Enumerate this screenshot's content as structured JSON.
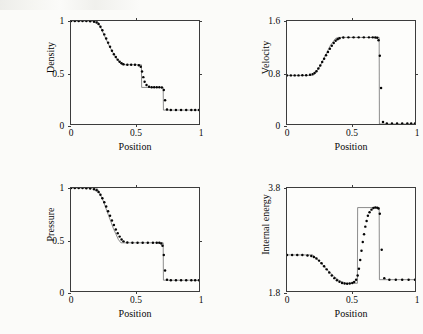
{
  "figure": {
    "type": "scientific-figure",
    "panel_count": 4,
    "background_color": "#fbfbf9",
    "exact_line_color": "#6e6e6e",
    "marker_color": "#050505"
  },
  "axis_title_x": "Position",
  "chart_data": [
    {
      "id": "density",
      "type": "line",
      "title": "",
      "xlabel": "Position",
      "ylabel": "Density",
      "xlim": [
        0,
        1
      ],
      "ylim": [
        0,
        1
      ],
      "xticks": [
        0,
        0.5,
        1
      ],
      "xticklabels": [
        "0",
        "0.5",
        "1"
      ],
      "yticks": [
        0,
        0.5,
        1
      ],
      "yticklabels": [
        "0",
        "0.5",
        "1"
      ],
      "grid": false,
      "legend": "none",
      "series": [
        {
          "name": "exact",
          "style": "thin-line",
          "x": [
            0.0,
            0.2,
            0.215,
            0.26,
            0.3,
            0.34,
            0.38,
            0.4,
            0.55,
            0.552,
            0.72,
            0.722,
            1.0
          ],
          "y": [
            1.0,
            1.0,
            0.985,
            0.86,
            0.755,
            0.665,
            0.595,
            0.575,
            0.575,
            0.355,
            0.355,
            0.135,
            0.135
          ]
        },
        {
          "name": "numerical",
          "style": "thick-dots",
          "x": [
            0.0,
            0.03,
            0.06,
            0.09,
            0.12,
            0.15,
            0.18,
            0.2,
            0.215,
            0.23,
            0.245,
            0.26,
            0.275,
            0.29,
            0.305,
            0.32,
            0.335,
            0.35,
            0.365,
            0.38,
            0.395,
            0.41,
            0.44,
            0.47,
            0.5,
            0.53,
            0.545,
            0.555,
            0.565,
            0.575,
            0.59,
            0.61,
            0.63,
            0.65,
            0.67,
            0.69,
            0.71,
            0.725,
            0.735,
            0.75,
            0.78,
            0.82,
            0.86,
            0.9,
            0.94,
            0.97,
            1.0
          ],
          "y": [
            1.0,
            1.0,
            1.0,
            1.0,
            1.0,
            0.998,
            0.993,
            0.985,
            0.97,
            0.945,
            0.91,
            0.87,
            0.83,
            0.79,
            0.75,
            0.712,
            0.678,
            0.65,
            0.625,
            0.605,
            0.59,
            0.58,
            0.575,
            0.575,
            0.575,
            0.57,
            0.555,
            0.51,
            0.455,
            0.41,
            0.378,
            0.362,
            0.357,
            0.356,
            0.356,
            0.356,
            0.354,
            0.33,
            0.23,
            0.14,
            0.136,
            0.135,
            0.135,
            0.135,
            0.135,
            0.135,
            0.135
          ]
        }
      ]
    },
    {
      "id": "velocity",
      "type": "line",
      "title": "",
      "xlabel": "Position",
      "ylabel": "Velocity",
      "xlim": [
        0,
        1
      ],
      "ylim": [
        0,
        1.6
      ],
      "xticks": [
        0,
        0.5,
        1
      ],
      "xticklabels": [
        "0",
        "0.5",
        "1"
      ],
      "yticks": [
        0,
        0.8,
        1.6
      ],
      "yticklabels": [
        "0",
        "0.8",
        "1.6"
      ],
      "grid": false,
      "legend": "none",
      "series": [
        {
          "name": "exact",
          "style": "thin-line",
          "x": [
            0.0,
            0.2,
            0.215,
            0.26,
            0.3,
            0.34,
            0.38,
            0.4,
            0.72,
            0.722,
            1.0
          ],
          "y": [
            0.755,
            0.755,
            0.77,
            0.905,
            1.065,
            1.225,
            1.33,
            1.345,
            1.345,
            0.0,
            0.0
          ]
        },
        {
          "name": "numerical",
          "style": "thick-dots",
          "x": [
            0.0,
            0.03,
            0.06,
            0.09,
            0.12,
            0.15,
            0.18,
            0.2,
            0.215,
            0.23,
            0.245,
            0.26,
            0.275,
            0.29,
            0.305,
            0.32,
            0.335,
            0.35,
            0.365,
            0.38,
            0.395,
            0.41,
            0.44,
            0.48,
            0.52,
            0.56,
            0.6,
            0.64,
            0.67,
            0.69,
            0.705,
            0.715,
            0.725,
            0.735,
            0.75,
            0.78,
            0.82,
            0.86,
            0.9,
            0.94,
            0.97,
            1.0
          ],
          "y": [
            0.755,
            0.755,
            0.755,
            0.755,
            0.756,
            0.758,
            0.765,
            0.775,
            0.792,
            0.82,
            0.862,
            0.91,
            0.962,
            1.015,
            1.068,
            1.12,
            1.17,
            1.215,
            1.258,
            1.292,
            1.318,
            1.332,
            1.344,
            1.346,
            1.346,
            1.346,
            1.346,
            1.346,
            1.346,
            1.345,
            1.34,
            1.3,
            1.06,
            0.56,
            0.03,
            0.01,
            0.008,
            0.008,
            0.008,
            0.008,
            0.008,
            0.008
          ]
        }
      ]
    },
    {
      "id": "pressure",
      "type": "line",
      "title": "",
      "xlabel": "Position",
      "ylabel": "Pressure",
      "xlim": [
        0,
        1
      ],
      "ylim": [
        0,
        1
      ],
      "xticks": [
        0,
        0.5,
        1
      ],
      "xticklabels": [
        "0",
        "0.5",
        "1"
      ],
      "yticks": [
        0,
        0.5,
        1
      ],
      "yticklabels": [
        "0",
        "0.5",
        "1"
      ],
      "grid": false,
      "legend": "none",
      "series": [
        {
          "name": "exact",
          "style": "thin-line",
          "x": [
            0.0,
            0.2,
            0.215,
            0.25,
            0.29,
            0.33,
            0.37,
            0.39,
            0.72,
            0.722,
            1.0
          ],
          "y": [
            1.0,
            1.0,
            0.975,
            0.88,
            0.745,
            0.61,
            0.5,
            0.468,
            0.468,
            0.105,
            0.105
          ]
        },
        {
          "name": "numerical",
          "style": "thick-dots",
          "x": [
            0.0,
            0.03,
            0.06,
            0.09,
            0.12,
            0.15,
            0.18,
            0.2,
            0.215,
            0.23,
            0.245,
            0.26,
            0.275,
            0.29,
            0.305,
            0.32,
            0.335,
            0.35,
            0.365,
            0.38,
            0.395,
            0.41,
            0.44,
            0.48,
            0.52,
            0.56,
            0.6,
            0.64,
            0.67,
            0.69,
            0.705,
            0.715,
            0.725,
            0.735,
            0.75,
            0.78,
            0.82,
            0.86,
            0.9,
            0.94,
            0.97,
            1.0
          ],
          "y": [
            1.0,
            1.0,
            1.0,
            1.0,
            0.998,
            0.995,
            0.988,
            0.978,
            0.962,
            0.935,
            0.9,
            0.862,
            0.82,
            0.775,
            0.73,
            0.685,
            0.64,
            0.598,
            0.56,
            0.528,
            0.5,
            0.482,
            0.47,
            0.468,
            0.468,
            0.468,
            0.468,
            0.468,
            0.468,
            0.468,
            0.462,
            0.44,
            0.35,
            0.2,
            0.11,
            0.105,
            0.105,
            0.105,
            0.105,
            0.105,
            0.105,
            0.105
          ]
        }
      ]
    },
    {
      "id": "internal-energy",
      "type": "line",
      "title": "",
      "xlabel": "Position",
      "ylabel": "Internal energy",
      "xlim": [
        0,
        1
      ],
      "ylim": [
        1.8,
        3.8
      ],
      "xticks": [
        0,
        0.5,
        1
      ],
      "xticklabels": [
        "0",
        "0.5",
        "1"
      ],
      "yticks": [
        1.8,
        3.8
      ],
      "yticklabels": [
        "1.8",
        "3.8"
      ],
      "grid": false,
      "legend": "none",
      "series": [
        {
          "name": "exact",
          "style": "thin-line",
          "x": [
            0.0,
            0.2,
            0.215,
            0.26,
            0.31,
            0.36,
            0.41,
            0.46,
            0.55,
            0.552,
            0.72,
            0.722,
            1.0
          ],
          "y": [
            2.5,
            2.5,
            2.47,
            2.36,
            2.22,
            2.1,
            2.0,
            1.95,
            1.95,
            3.42,
            3.42,
            2.02,
            2.02
          ]
        },
        {
          "name": "numerical",
          "style": "thick-dots",
          "x": [
            0.0,
            0.04,
            0.08,
            0.12,
            0.16,
            0.19,
            0.21,
            0.23,
            0.25,
            0.27,
            0.29,
            0.31,
            0.33,
            0.35,
            0.37,
            0.39,
            0.41,
            0.43,
            0.45,
            0.47,
            0.49,
            0.51,
            0.525,
            0.54,
            0.552,
            0.562,
            0.572,
            0.582,
            0.592,
            0.602,
            0.612,
            0.622,
            0.632,
            0.645,
            0.66,
            0.675,
            0.69,
            0.705,
            0.715,
            0.725,
            0.74,
            0.76,
            0.8,
            0.85,
            0.9,
            0.95,
            1.0
          ],
          "y": [
            2.5,
            2.5,
            2.5,
            2.5,
            2.49,
            2.48,
            2.46,
            2.43,
            2.39,
            2.34,
            2.28,
            2.22,
            2.16,
            2.1,
            2.05,
            2.01,
            1.98,
            1.955,
            1.945,
            1.942,
            1.945,
            1.955,
            1.975,
            2.02,
            2.1,
            2.23,
            2.4,
            2.58,
            2.75,
            2.9,
            3.05,
            3.16,
            3.26,
            3.33,
            3.38,
            3.41,
            3.42,
            3.415,
            3.4,
            3.3,
            2.6,
            2.05,
            2.02,
            2.02,
            2.02,
            2.02,
            2.02
          ]
        }
      ]
    }
  ]
}
